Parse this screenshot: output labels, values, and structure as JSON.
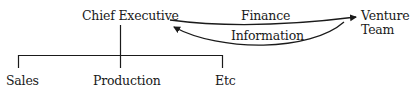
{
  "diagram": {
    "nodes": {
      "chief_executive": "Chief Executive",
      "venture_team_line1": "Venture",
      "venture_team_line2": "Team",
      "sales": "Sales",
      "production": "Production",
      "etc": "Etc"
    },
    "edges": {
      "finance": "Finance",
      "information": "Information"
    },
    "colors": {
      "ink": "#1a1a1a",
      "background": "#ffffff"
    }
  }
}
